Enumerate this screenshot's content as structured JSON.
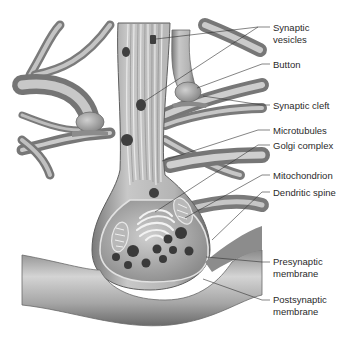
{
  "colors": {
    "background": "#ffffff",
    "tissue_dark": "#6e6e6e",
    "tissue_mid": "#a8a8a8",
    "tissue_light": "#d6d6d6",
    "vesicle": "#3c3c3c",
    "leader_line": "#333333",
    "label_text": "#2a2a2a"
  },
  "labels": [
    {
      "id": "synaptic-vesicles",
      "line1": "Synaptic",
      "line2": "vesicles",
      "y": 22
    },
    {
      "id": "button",
      "line1": "Button",
      "line2": "",
      "y": 59
    },
    {
      "id": "synaptic-cleft",
      "line1": "Synaptic cleft",
      "line2": "",
      "y": 100
    },
    {
      "id": "microtubules",
      "line1": "Microtubules",
      "line2": "",
      "y": 125
    },
    {
      "id": "golgi-complex",
      "line1": "Golgi complex",
      "line2": "",
      "y": 140
    },
    {
      "id": "mitochondrion",
      "line1": "Mitochondrion",
      "line2": "",
      "y": 170
    },
    {
      "id": "dendritic-spine",
      "line1": "Dendritic spine",
      "line2": "",
      "y": 187
    },
    {
      "id": "presynaptic-membrane",
      "line1": "Presynaptic",
      "line2": "membrane",
      "y": 256
    },
    {
      "id": "postsynaptic-membrane",
      "line1": "Postsynaptic",
      "line2": "membrane",
      "y": 294
    }
  ]
}
